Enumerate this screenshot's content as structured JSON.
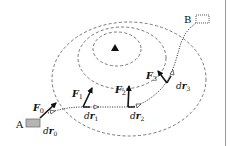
{
  "diagram": {
    "points": {
      "start": "A",
      "end": "B"
    },
    "forces": [
      {
        "symbol": "F",
        "sub": "0"
      },
      {
        "symbol": "F",
        "sub": "1"
      },
      {
        "symbol": "F",
        "sub": "2"
      },
      {
        "symbol": "F",
        "sub": "3"
      }
    ],
    "displacements": [
      {
        "symbol": "dr",
        "d": "d",
        "r": "r",
        "sub": "0"
      },
      {
        "symbol": "dr",
        "d": "d",
        "r": "r",
        "sub": "1"
      },
      {
        "symbol": "dr",
        "d": "d",
        "r": "r",
        "sub": "2"
      },
      {
        "symbol": "dr",
        "d": "d",
        "r": "r",
        "sub": "3"
      }
    ],
    "source_marker": "triangle",
    "colors": {
      "stroke": "#111111",
      "dashed": "#555555",
      "box_fill": "#b5b5b5",
      "divider": "#9a9a9a"
    }
  }
}
